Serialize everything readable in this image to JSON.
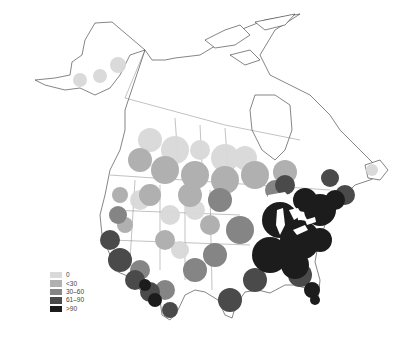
{
  "map": {
    "region": "North America",
    "legend": {
      "items": [
        {
          "label": "0",
          "color": "#d9d9d9"
        },
        {
          "label": "<30",
          "color": "#b0b0b0"
        },
        {
          "label": "30–60",
          "color": "#858585"
        },
        {
          "label": "61–90",
          "color": "#4a4a4a"
        },
        {
          "label": ">90",
          "color": "#1c1c1c"
        }
      ]
    },
    "colors": {
      "background": "#ffffff",
      "outline": "#333333",
      "land": "#ffffff",
      "lakes": "#ffffff"
    }
  }
}
